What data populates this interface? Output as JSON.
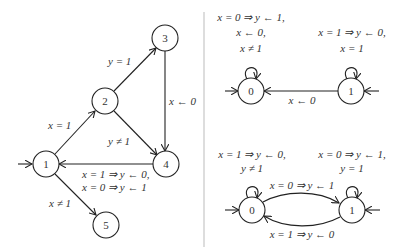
{
  "left_diagram": {
    "nodes": [
      {
        "id": "1",
        "label": "1",
        "x": 46,
        "y": 164,
        "initial": true
      },
      {
        "id": "2",
        "label": "2",
        "x": 105,
        "y": 101
      },
      {
        "id": "3",
        "label": "3",
        "x": 165,
        "y": 38
      },
      {
        "id": "4",
        "label": "4",
        "x": 166,
        "y": 164
      },
      {
        "id": "5",
        "label": "5",
        "x": 106,
        "y": 225
      }
    ],
    "edges": [
      {
        "from": "1",
        "to": "2",
        "label": "x = 1"
      },
      {
        "from": "2",
        "to": "3",
        "label": "y = 1"
      },
      {
        "from": "3",
        "to": "4",
        "label": "x ← 0"
      },
      {
        "from": "2",
        "to": "4",
        "label": "y ≠ 1"
      },
      {
        "from": "4",
        "to": "1",
        "label_lines": [
          "x = 1 ⇒ y ← 0,",
          "x = 0 ⇒ y ← 1"
        ]
      },
      {
        "from": "1",
        "to": "5",
        "label": "x ≠ 1"
      }
    ]
  },
  "top_right_diagram": {
    "nodes": [
      {
        "id": "0",
        "label": "0",
        "x": 251,
        "y": 91,
        "initial": true
      },
      {
        "id": "1",
        "label": "1",
        "x": 351,
        "y": 91,
        "initial": true
      }
    ],
    "self_loop_0_lines": [
      "x = 0 ⇒ y ← 1,",
      "x ← 0,",
      "x ≠ 1"
    ],
    "self_loop_1_lines": [
      "x = 1 ⇒ y ← 0,",
      "x = 1"
    ],
    "edge_1_to_0": "x ← 0"
  },
  "bottom_right_diagram": {
    "nodes": [
      {
        "id": "0",
        "label": "0",
        "x": 252,
        "y": 210,
        "initial": true
      },
      {
        "id": "1",
        "label": "1",
        "x": 352,
        "y": 210,
        "initial": true
      }
    ],
    "self_loop_0_lines": [
      "x = 1 ⇒ y ← 0,",
      "y ≠ 1"
    ],
    "self_loop_1_lines": [
      "x = 0 ⇒ y ← 1,",
      "y = 1"
    ],
    "edge_0_to_1": "x = 0 ⇒ y ← 1",
    "edge_1_to_0": "x = 1 ⇒ y ← 0"
  }
}
